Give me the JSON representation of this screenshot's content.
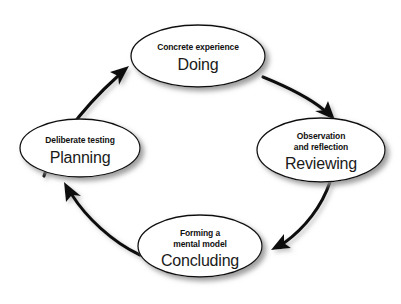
{
  "diagram": {
    "background_color": "#ffffff",
    "stroke_color": "#111111",
    "shadow_color": "#9a9a9a",
    "direction": "clockwise",
    "nodes": [
      {
        "id": "doing",
        "caption": "Concrete experience",
        "label": "Doing",
        "cx": 198,
        "cy": 56,
        "rx": 67,
        "ry": 31
      },
      {
        "id": "reviewing",
        "caption_line1": "Observation",
        "caption_line2": "and reflection",
        "label": "Reviewing",
        "cx": 321,
        "cy": 150,
        "rx": 64,
        "ry": 32
      },
      {
        "id": "concluding",
        "caption_line1": "Forming a",
        "caption_line2": "mental model",
        "label": "Concluding",
        "cx": 200,
        "cy": 246,
        "rx": 62,
        "ry": 31
      },
      {
        "id": "planning",
        "caption": "Deliberate testing",
        "label": "Planning",
        "cx": 80,
        "cy": 148,
        "rx": 60,
        "ry": 29
      }
    ],
    "arrows": [
      {
        "id": "arrow-doing-to-reviewing",
        "from": "doing",
        "to": "reviewing"
      },
      {
        "id": "arrow-reviewing-to-concluding",
        "from": "reviewing",
        "to": "concluding"
      },
      {
        "id": "arrow-concluding-to-planning",
        "from": "concluding",
        "to": "planning"
      },
      {
        "id": "arrow-planning-to-doing",
        "from": "planning",
        "to": "doing"
      }
    ]
  }
}
